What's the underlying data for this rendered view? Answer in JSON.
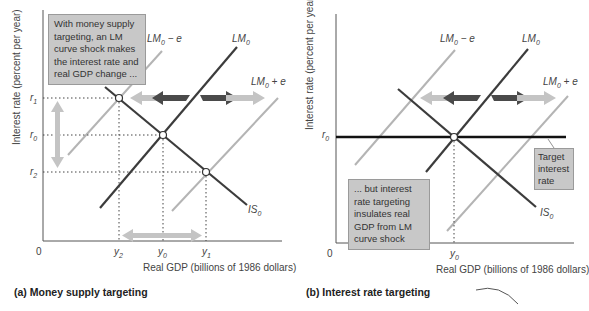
{
  "panel_a": {
    "caption": "(a) Money supply targeting",
    "y_axis_label": "Interest rate (percent per year)",
    "x_axis_label": "Real GDP (billions of 1986 dollars)",
    "origin": "0",
    "note": "With money supply targeting, an LM curve shock makes the interest rate and real GDP change ...",
    "curves": {
      "lm_minus": "LM0 − e",
      "lm": "LM0",
      "lm_plus": "LM0 + e",
      "is": "IS0"
    },
    "y_ticks": [
      "r1",
      "r0",
      "r2"
    ],
    "x_ticks": [
      "y2",
      "y0",
      "y1"
    ]
  },
  "panel_b": {
    "caption": "(b) Interest rate targeting",
    "y_axis_label": "Interest rate (percent per year)",
    "x_axis_label": "Real GDP (billions of 1986 dollars)",
    "origin": "0",
    "note": "... but interest rate targeting insulates real GDP from LM curve shock",
    "target_label": "Target interest rate",
    "curves": {
      "lm_minus": "LM0 − e",
      "lm": "LM0",
      "lm_plus": "LM0 + e",
      "is": "IS0"
    },
    "y_ticks": [
      "r0"
    ],
    "x_ticks": [
      "y0"
    ]
  },
  "colors": {
    "dark_curve": "#3c3c3c",
    "light_curve": "#b4b4b4",
    "dark_arrow": "#4a4a4a",
    "light_arrow": "#c4c4c4",
    "note_bg": "#c8c8c8",
    "target_line": "#111111"
  }
}
